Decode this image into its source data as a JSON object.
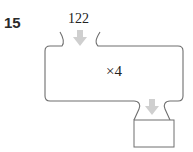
{
  "question": {
    "number": "15"
  },
  "machine": {
    "input_value": "122",
    "operation": "×4",
    "output_value": ""
  },
  "colors": {
    "outline": "#6e6e6e",
    "arrow": "#cfcfcf",
    "text": "#222222"
  }
}
